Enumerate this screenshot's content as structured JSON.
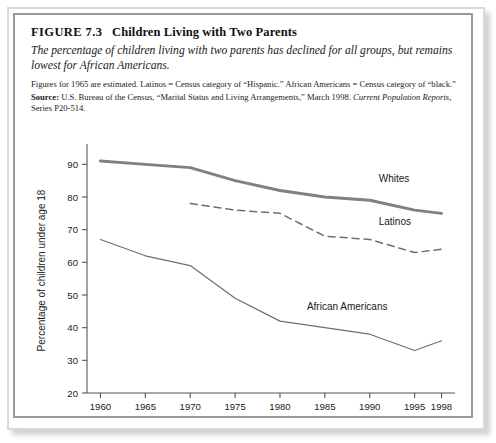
{
  "figure": {
    "label": "FIGURE 7.3",
    "title": "Children Living with Two Parents",
    "subtitle": "The percentage of children living with two parents has declined for all groups, but remains lowest for African Americans.",
    "note": "Figures for 1965 are estimated. Latinos = Census category of “Hispanic.” African Americans = Census category of “black.”",
    "source_label": "Source:",
    "source_text_1": "U.S. Bureau of the Census, “Marital Status and Living Arrangements,” March 1998.",
    "source_italic": "Current Population Reports,",
    "source_text_2": "Series P20-514."
  },
  "colors": {
    "frame_outer": "#d9d9d9",
    "frame_inner": "#9a9a9a",
    "axis": "#555555",
    "whites_line": "#808080",
    "latinos_line": "#6e6e6e",
    "african_americans_line": "#6e6e6e",
    "text": "#222222",
    "background": "#ffffff"
  },
  "chart_data": {
    "type": "line",
    "title": "",
    "xlabel": "",
    "ylabel": "Percentage of children under age 18",
    "x": [
      1960,
      1965,
      1970,
      1975,
      1980,
      1985,
      1990,
      1995,
      1998
    ],
    "xtick_labels": [
      "1960",
      "1965",
      "1970",
      "1975",
      "1980",
      "1985",
      "1990",
      "1995",
      "1998"
    ],
    "ytick_labels": [
      "20",
      "30",
      "40",
      "50",
      "60",
      "70",
      "80",
      "90"
    ],
    "yticks": [
      20,
      30,
      40,
      50,
      60,
      70,
      80,
      90
    ],
    "ylim": [
      20,
      95
    ],
    "xlim": [
      1958.5,
      1999.5
    ],
    "grid": false,
    "legend_position": "inline-right",
    "series": [
      {
        "name": "Whites",
        "style": "solid-thick",
        "x": [
          1960,
          1965,
          1970,
          1975,
          1980,
          1985,
          1990,
          1995,
          1998
        ],
        "values": [
          91,
          90,
          89,
          85,
          82,
          80,
          79,
          76,
          75
        ],
        "label_x": 1991.0,
        "label_y": 84.5
      },
      {
        "name": "Latinos",
        "style": "dashed",
        "x": [
          1970,
          1975,
          1980,
          1985,
          1990,
          1995,
          1998
        ],
        "values": [
          78,
          76,
          75,
          68,
          67,
          63,
          64
        ],
        "label_x": 1991.0,
        "label_y": 71.5
      },
      {
        "name": "African Americans",
        "style": "solid-thin",
        "x": [
          1960,
          1965,
          1970,
          1975,
          1980,
          1985,
          1990,
          1995,
          1998
        ],
        "values": [
          67,
          62,
          59,
          49,
          42,
          40,
          38,
          33,
          36
        ],
        "label_x": 1983.0,
        "label_y": 45.5
      }
    ]
  }
}
